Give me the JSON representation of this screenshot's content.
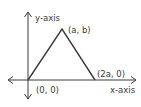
{
  "diagram": {
    "type": "coordinate-triangle",
    "colors": {
      "stroke": "#3a3a3a",
      "background": "#ffffff"
    },
    "axes": {
      "x_label": "x-axis",
      "y_label": "y-axis"
    },
    "vertices": [
      {
        "id": "origin",
        "label": "(0, 0)"
      },
      {
        "id": "apex",
        "label": "(a, b)"
      },
      {
        "id": "right",
        "label": "(2a, 0)"
      }
    ]
  }
}
